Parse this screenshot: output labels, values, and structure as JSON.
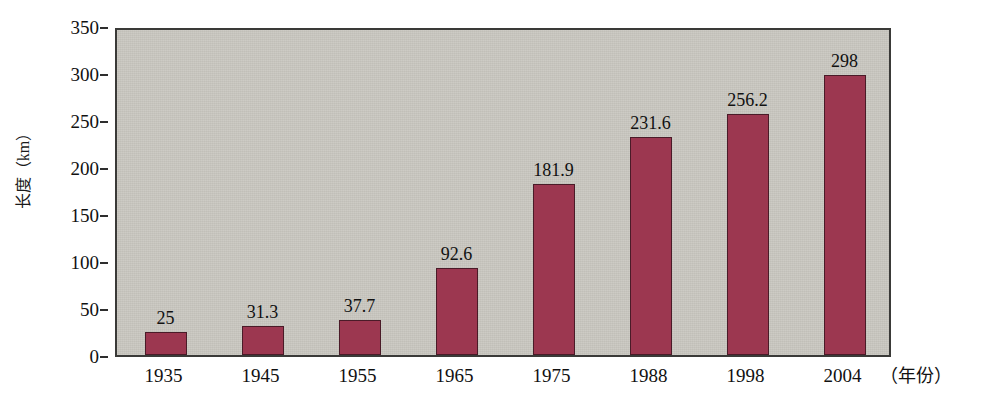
{
  "chart_data": {
    "type": "bar",
    "title": "",
    "subtitle": "",
    "xlabel": "年份",
    "xlabel_display": "（年份）",
    "ylabel": "长度（km）",
    "categories": [
      "1935",
      "1945",
      "1955",
      "1965",
      "1975",
      "1988",
      "1998",
      "2004"
    ],
    "values": [
      25,
      31.3,
      37.7,
      92.6,
      181.9,
      231.6,
      256.2,
      298
    ],
    "value_labels": [
      "25",
      "31.3",
      "37.7",
      "92.6",
      "181.9",
      "231.6",
      "256.2",
      "298"
    ],
    "ylim": [
      0,
      350
    ],
    "ytick_labels": [
      "0",
      "50",
      "100",
      "150",
      "200",
      "250",
      "300",
      "350"
    ],
    "ytick_values": [
      0,
      50,
      100,
      150,
      200,
      250,
      300,
      350
    ],
    "grid": false,
    "legend": null,
    "legend_position": "none",
    "series": [
      {
        "name": "长度",
        "values": [
          25,
          31.3,
          37.7,
          92.6,
          181.9,
          231.6,
          256.2,
          298
        ]
      }
    ]
  },
  "colors": {
    "bar_fill": "#9c3750",
    "bar_border": "#4a1b28",
    "plot_background": "#c8c6bf",
    "plot_border": "#3a3a38",
    "page_background": "#ffffff",
    "text": "#111111"
  }
}
